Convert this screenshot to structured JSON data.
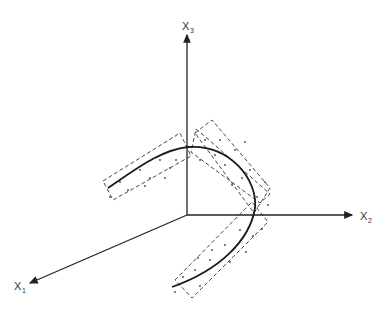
{
  "diagram": {
    "axes": [
      {
        "id": "x1",
        "label": "X",
        "subscript": "1"
      },
      {
        "id": "x2",
        "label": "X",
        "subscript": "2"
      },
      {
        "id": "x3",
        "label": "X",
        "subscript": "3"
      }
    ],
    "colors": {
      "line": "#222222",
      "dashed": "#333333",
      "points": "#444444",
      "background": "#ffffff"
    }
  }
}
